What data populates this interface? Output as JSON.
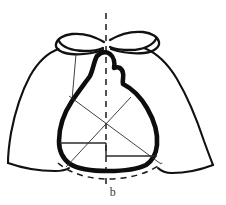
{
  "figure": {
    "kind": "medical-schematic",
    "panel_label": "b",
    "colors": {
      "background": "#ffffff",
      "thorax_outline": "#111111",
      "heart_outline": "#0d0d0d",
      "measurement_line": "#2b2b2b",
      "dashed_guide": "#1a1a1a",
      "label_text": "#3a3a3a"
    },
    "stroke_widths": {
      "thorax_outline": 2.1,
      "clavicle": 2.3,
      "heart_outline": 4.6,
      "measurement_line": 0.9,
      "dashed_guide": 1.5
    },
    "elements": [
      {
        "name": "left-lung-outline",
        "label": "Left lung field border"
      },
      {
        "name": "right-lung-outline",
        "label": "Right lung field border"
      },
      {
        "name": "left-clavicle",
        "label": "Left clavicle"
      },
      {
        "name": "right-clavicle",
        "label": "Right clavicle"
      },
      {
        "name": "heart-silhouette",
        "label": "Cardiac silhouette"
      },
      {
        "name": "midline-axis",
        "label": "Vertical midline (dashed)"
      },
      {
        "name": "diaphragm-arc",
        "label": "Diaphragm contour (dashed)"
      },
      {
        "name": "left-cardiac-width-line",
        "label": "Left cardiac half-width"
      },
      {
        "name": "right-cardiac-width-line",
        "label": "Right cardiac half-width"
      },
      {
        "name": "diagonal-measure-a",
        "label": "Oblique measurement line A"
      },
      {
        "name": "diagonal-measure-b",
        "label": "Oblique measurement line B"
      },
      {
        "name": "left-apex-drop-line",
        "label": "Thin vertical reference line"
      }
    ]
  }
}
